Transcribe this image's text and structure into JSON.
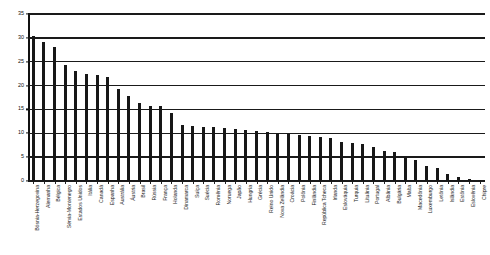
{
  "chart_data": {
    "type": "bar",
    "title": "",
    "subtitle": "",
    "xlabel": "",
    "ylabel": "",
    "ylim": [
      0,
      35
    ],
    "yticks": [
      0,
      5,
      10,
      15,
      20,
      25,
      30,
      35
    ],
    "grid": true,
    "legend": false,
    "orientation": "vertical",
    "bar_color": "#171717",
    "categories": [
      "Bósnia-Herzegovina",
      "Alemanha",
      "Bélgica",
      "Sérvia-Montenegro",
      "Estados Unidos",
      "Itália",
      "Canadá",
      "Espanha",
      "Austrália",
      "Áustria",
      "Brasil",
      "Rússia",
      "França",
      "Holanda",
      "Dinamarca",
      "Suíça",
      "Suécia",
      "Romênia",
      "Noruega",
      "Japão",
      "Hungria",
      "Grécia",
      "Reino Unido",
      "Nova Zelândia",
      "Croácia",
      "Polônia",
      "Finlândia",
      "República Tcheca",
      "Irlanda",
      "Eslováquia",
      "Turquia",
      "Lituânia",
      "Portugal",
      "Albânia",
      "Bulgária",
      "Malta",
      "Macedônia",
      "Luxemburgo",
      "Letônia",
      "Islândia",
      "Estônia",
      "Eslovênia",
      "Chipre"
    ],
    "values": [
      30.3,
      29.2,
      28.0,
      24.3,
      23.0,
      22.4,
      22.3,
      21.9,
      19.2,
      17.8,
      16.3,
      15.7,
      15.7,
      14.3,
      11.8,
      11.6,
      11.4,
      11.3,
      11.1,
      10.9,
      10.7,
      10.5,
      10.3,
      10.1,
      9.9,
      9.7,
      9.5,
      9.3,
      9.0,
      8.2,
      7.9,
      7.7,
      7.2,
      6.3,
      6.0,
      4.8,
      4.3,
      3.2,
      2.8,
      1.4,
      0.9,
      0.5,
      0.2
    ]
  }
}
